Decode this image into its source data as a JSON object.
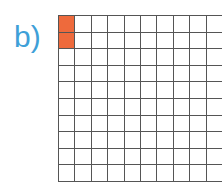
{
  "label": "b)",
  "grid": {
    "rows": 10,
    "cols": 10,
    "filled_cells": [
      [
        0,
        0
      ],
      [
        1,
        0
      ]
    ],
    "fill_color": "#ee6a3c",
    "line_color": "#555555"
  },
  "colors": {
    "label": "#3ea0d8"
  }
}
